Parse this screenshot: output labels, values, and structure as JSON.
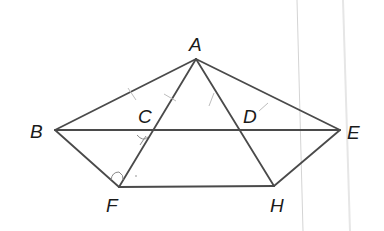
{
  "diagram": {
    "points": {
      "A": {
        "label": "A",
        "x": 196,
        "y": 59
      },
      "B": {
        "label": "B",
        "x": 55,
        "y": 130
      },
      "C": {
        "label": "C",
        "x": 152,
        "y": 130
      },
      "D": {
        "label": "D",
        "x": 240,
        "y": 130
      },
      "E": {
        "label": "E",
        "x": 340,
        "y": 130
      },
      "F": {
        "label": "F",
        "x": 119,
        "y": 187
      },
      "H": {
        "label": "H",
        "x": 274,
        "y": 186
      }
    },
    "segments": [
      "AB",
      "AE",
      "AF",
      "AH",
      "BE",
      "BF",
      "FH",
      "HE"
    ],
    "markings": {
      "ticks": [
        "AB",
        "AC",
        "AD",
        "DE"
      ],
      "angle_arcs": [
        "BCF",
        "BFC"
      ]
    },
    "colors": {
      "line": "#4a4a4a",
      "label": "#1a1a1a",
      "tick": "#bdbdbd",
      "background": "#ffffff"
    }
  }
}
